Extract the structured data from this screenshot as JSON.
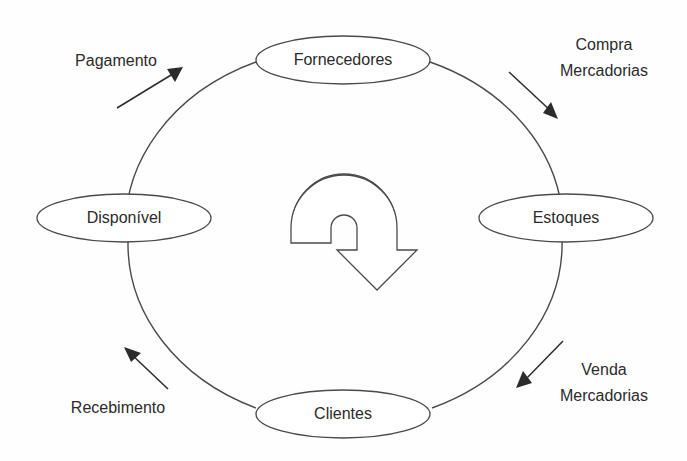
{
  "diagram": {
    "type": "cycle-diagram",
    "colors": {
      "background": "#fefefe",
      "stroke": "#4a4a4a",
      "text": "#2b2b2b",
      "arrow": "#2b2b2b"
    },
    "nodes": [
      {
        "id": "fornecedores",
        "label": "Fornecedores",
        "position": "top"
      },
      {
        "id": "estoques",
        "label": "Estoques",
        "position": "right"
      },
      {
        "id": "clientes",
        "label": "Clientes",
        "position": "bottom"
      },
      {
        "id": "disponivel",
        "label": "Disponível",
        "position": "left"
      }
    ],
    "flows": [
      {
        "id": "compra-mercadorias",
        "lines": [
          "Compra",
          "Mercadorias"
        ],
        "position": "top-right",
        "direction": "down-right",
        "from": "fornecedores",
        "to": "estoques"
      },
      {
        "id": "venda-mercadorias",
        "lines": [
          "Venda",
          "Mercadorias"
        ],
        "position": "bottom-right",
        "direction": "down-left",
        "from": "estoques",
        "to": "clientes"
      },
      {
        "id": "recebimento",
        "lines": [
          "Recebimento"
        ],
        "position": "bottom-left",
        "direction": "up-left",
        "from": "clientes",
        "to": "disponivel"
      },
      {
        "id": "pagamento",
        "lines": [
          "Pagamento"
        ],
        "position": "top-left",
        "direction": "up-right",
        "from": "disponivel",
        "to": "fornecedores"
      }
    ],
    "center_glyph": {
      "id": "rotation-arrow",
      "name": "u-turn-rotation-arrow",
      "direction": "clockwise"
    }
  }
}
